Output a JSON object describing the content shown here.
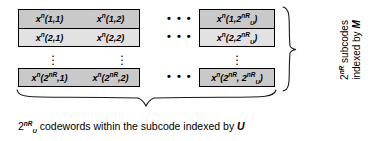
{
  "figure": {
    "name": "codebook-grid-diagram",
    "background_color": "#ffffff",
    "cell_fill_dark": "#c9c9c9",
    "cell_fill_light": "#e2e2e2",
    "border_color": "#000000"
  },
  "grid": {
    "rows": [
      {
        "row_id": "row-1",
        "cells": [
          {
            "base": "x",
            "exp": "n",
            "args": "(1,1)"
          },
          {
            "base": "x",
            "exp": "n",
            "args": "(1,2)"
          },
          {
            "base": "x",
            "exp": "n",
            "args": "(1,2",
            "args_exp": "nR",
            "args_sub": "U",
            "args_tail": ")"
          }
        ]
      },
      {
        "row_id": "row-2",
        "cells": [
          {
            "base": "x",
            "exp": "n",
            "args": "(2,1)"
          },
          {
            "base": "x",
            "exp": "n",
            "args": "(2,2)"
          },
          {
            "base": "x",
            "exp": "n",
            "args": "(2,2",
            "args_exp": "nR",
            "args_sub": "U",
            "args_tail": ")"
          }
        ]
      },
      {
        "row_id": "row-last",
        "cells": [
          {
            "base": "x",
            "exp": "n",
            "args_open": "(2",
            "args_exp": "nR",
            "args_mid": ",1)"
          },
          {
            "base": "x",
            "exp": "n",
            "args_open": "(2",
            "args_exp": "nR",
            "args_mid": ",2)"
          },
          {
            "base": "x",
            "exp": "n",
            "args_open": "(2",
            "args_exp": "nR",
            "args_mid": ", 2",
            "args_exp2": "nR",
            "args_sub2": "U",
            "args_tail": ")"
          }
        ]
      }
    ],
    "column_ellipsis": "• • •",
    "row_ellipsis_dot": "."
  },
  "captions": {
    "bottom": {
      "prefix": "2",
      "exp": "nR",
      "exp_sub": "U",
      "text": " codewords within the subcode indexed by ",
      "symbol": "U"
    },
    "right": {
      "line1_prefix": "2",
      "line1_exp": "nR",
      "line1_text": " subcodes",
      "line2_text": "indexed by ",
      "line2_symbol": "M"
    }
  }
}
